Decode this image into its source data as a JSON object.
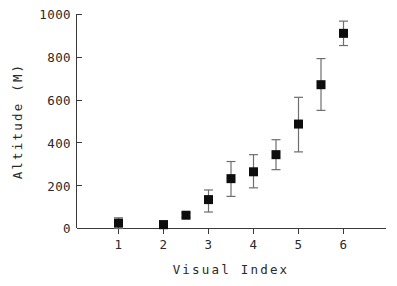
{
  "chart_data": {
    "type": "scatter",
    "title": "",
    "xlabel": "Visual Index",
    "ylabel": "Altitude (M)",
    "xlim": [
      0.5,
      6.5
    ],
    "ylim": [
      0,
      1000
    ],
    "grid": false,
    "legend": null,
    "x_ticks": [
      1,
      2,
      3,
      4,
      5,
      6
    ],
    "x_tick_labels": [
      "1",
      "2",
      "3",
      "4",
      "5",
      "6"
    ],
    "y_ticks": [
      0,
      200,
      400,
      600,
      800,
      1000
    ],
    "y_tick_labels": [
      "0",
      "200",
      "400",
      "600",
      "800",
      "1000"
    ],
    "marker": "filled-square",
    "marker_color": "#0d0d0d",
    "errorbar_color": "#6e6e6e",
    "series": [
      {
        "name": "Altitude",
        "points": [
          {
            "x": 1.0,
            "y": 25,
            "yerr_low": 25,
            "yerr_high": 25
          },
          {
            "x": 2.0,
            "y": 18,
            "yerr_low": 18,
            "yerr_high": 18
          },
          {
            "x": 2.5,
            "y": 62,
            "yerr_low": 10,
            "yerr_high": 10
          },
          {
            "x": 3.0,
            "y": 135,
            "yerr_low": 58,
            "yerr_high": 45
          },
          {
            "x": 3.5,
            "y": 233,
            "yerr_low": 83,
            "yerr_high": 80
          },
          {
            "x": 4.0,
            "y": 265,
            "yerr_low": 75,
            "yerr_high": 80
          },
          {
            "x": 4.5,
            "y": 345,
            "yerr_low": 70,
            "yerr_high": 70
          },
          {
            "x": 5.0,
            "y": 488,
            "yerr_low": 130,
            "yerr_high": 125
          },
          {
            "x": 5.5,
            "y": 672,
            "yerr_low": 120,
            "yerr_high": 122
          },
          {
            "x": 6.0,
            "y": 912,
            "yerr_low": 57,
            "yerr_high": 57
          }
        ]
      }
    ]
  },
  "figure": {
    "background_color": "#ffffff",
    "axis_color": "#3a3a3a",
    "text_color": "#2a2a2a"
  }
}
